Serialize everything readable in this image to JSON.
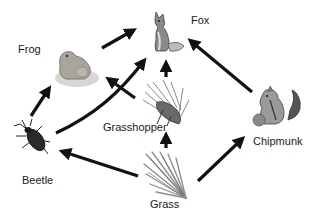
{
  "diagram": {
    "type": "food-web",
    "organisms": [
      {
        "id": "fox",
        "label": "Fox"
      },
      {
        "id": "frog",
        "label": "Frog"
      },
      {
        "id": "grasshopper",
        "label": "Grasshopper"
      },
      {
        "id": "beetle",
        "label": "Beetle"
      },
      {
        "id": "chipmunk",
        "label": "Chipmunk"
      },
      {
        "id": "grass",
        "label": "Grass"
      }
    ],
    "edges": [
      {
        "from": "frog",
        "to": "fox"
      },
      {
        "from": "beetle",
        "to": "frog"
      },
      {
        "from": "beetle",
        "to": "fox"
      },
      {
        "from": "grasshopper",
        "to": "frog"
      },
      {
        "from": "grasshopper",
        "to": "fox"
      },
      {
        "from": "grass",
        "to": "grasshopper"
      },
      {
        "from": "grass",
        "to": "beetle"
      },
      {
        "from": "grass",
        "to": "chipmunk"
      },
      {
        "from": "chipmunk",
        "to": "fox"
      }
    ],
    "colors": {
      "arrow": "#111111",
      "text": "#1a1a1a",
      "background": "#ffffff"
    }
  }
}
